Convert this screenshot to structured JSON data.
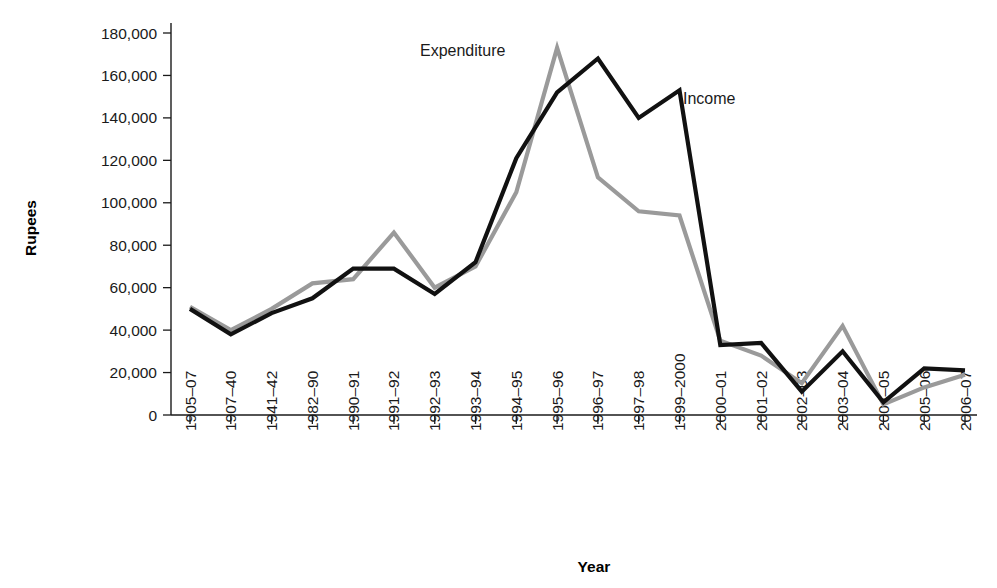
{
  "chart_data": {
    "type": "line",
    "title": "",
    "xlabel": "Year",
    "ylabel": "Rupees",
    "ylim": [
      0,
      180000
    ],
    "ytick_values": [
      0,
      20000,
      40000,
      60000,
      80000,
      100000,
      120000,
      140000,
      160000,
      180000
    ],
    "ytick_labels": [
      "0",
      "20,000",
      "40,000",
      "60,000",
      "80,000",
      "100,000",
      "120,000",
      "140,000",
      "160,000",
      "180,000"
    ],
    "grid": false,
    "legend_position": "inline-annotation",
    "categories": [
      "1905–07",
      "1907–40",
      "1941–42",
      "1982–90",
      "1990–91",
      "1991–92",
      "1992–93",
      "1993–94",
      "1994–95",
      "1995–96",
      "1996–97",
      "1997–98",
      "1999–2000",
      "2000–01",
      "2001–02",
      "2002–03",
      "2003–04",
      "2004–05",
      "2005–06",
      "2006–07"
    ],
    "series": [
      {
        "name": "Income",
        "color": "#111111",
        "values": [
          50000,
          38000,
          48000,
          55000,
          69000,
          69000,
          57000,
          72000,
          121000,
          152000,
          168000,
          140000,
          153000,
          33000,
          34000,
          11000,
          30000,
          6000,
          22000,
          21000
        ]
      },
      {
        "name": "Expenditure",
        "color": "#9a9a9a",
        "values": [
          51000,
          40000,
          50000,
          62000,
          64000,
          86000,
          60000,
          70000,
          105000,
          173000,
          112000,
          96000,
          94000,
          35000,
          28000,
          15000,
          42000,
          5000,
          13000,
          19000
        ]
      }
    ],
    "annotations": [
      {
        "text": "Expenditure",
        "x_px": 420,
        "y_px": 56
      },
      {
        "text": "Income",
        "x_px": 683,
        "y_px": 104
      }
    ]
  }
}
